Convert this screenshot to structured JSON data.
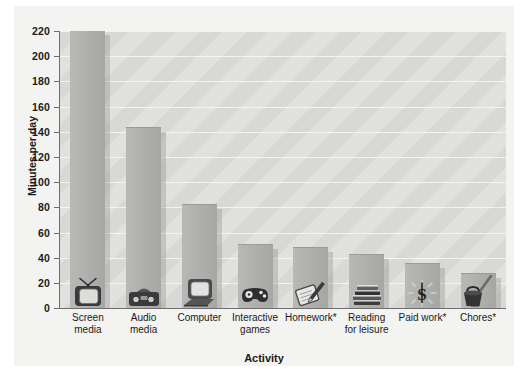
{
  "chart_data": {
    "type": "bar",
    "title": "",
    "xlabel": "Activity",
    "ylabel": "Minutes per day",
    "ylim": [
      0,
      220
    ],
    "ytick_labels": [
      "0",
      "20",
      "40",
      "60",
      "80",
      "100",
      "120",
      "140",
      "160",
      "180",
      "200",
      "220"
    ],
    "yticks": [
      0,
      20,
      40,
      60,
      80,
      100,
      120,
      140,
      160,
      180,
      200,
      220
    ],
    "grid": true,
    "legend": "none",
    "categories": [
      "Screen\nmedia",
      "Audio\nmedia",
      "Computer",
      "Interactive\ngames",
      "Homework*",
      "Reading\nfor leisure",
      "Paid work*",
      "Chores*"
    ],
    "category_lines": [
      [
        "Screen",
        "media"
      ],
      [
        "Audio",
        "media"
      ],
      [
        "Computer"
      ],
      [
        "Interactive",
        "games"
      ],
      [
        "Homework*"
      ],
      [
        "Reading",
        "for leisure"
      ],
      [
        "Paid work*"
      ],
      [
        "Chores*"
      ]
    ],
    "values": [
      220,
      143,
      82,
      50,
      48,
      42,
      35,
      27
    ],
    "icons": [
      "television-icon",
      "boombox-icon",
      "desktop-computer-icon",
      "game-controller-icon",
      "notebook-pencil-icon",
      "stack-of-books-icon",
      "dollar-coin-icon",
      "bucket-broom-icon"
    ],
    "colors": {
      "bar": "#adadab",
      "plot_background": "#d8d8d6",
      "panel_background": "#f3f3f2",
      "gridline": "#f2f2f0",
      "axis": "#6e6e6e",
      "text": "#1a1a1a"
    }
  }
}
